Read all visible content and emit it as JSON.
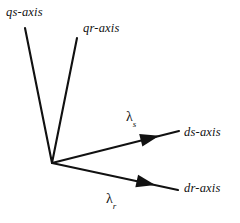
{
  "diagram": {
    "type": "axis-vector-diagram",
    "background_color": "#ffffff",
    "stroke_color": "#111111",
    "origin": {
      "x": 52,
      "y": 163
    },
    "axes": [
      {
        "id": "qs-axis",
        "label": "qs-axis",
        "has_arrowhead": false,
        "from": {
          "x": 52,
          "y": 163
        },
        "to": {
          "x": 25,
          "y": 28
        }
      },
      {
        "id": "qr-axis",
        "label": "qr-axis",
        "has_arrowhead": false,
        "from": {
          "x": 52,
          "y": 163
        },
        "to": {
          "x": 77,
          "y": 38
        }
      },
      {
        "id": "ds-axis",
        "label": "ds-axis",
        "has_arrowhead": true,
        "from": {
          "x": 52,
          "y": 163
        },
        "to": {
          "x": 179,
          "y": 131
        },
        "arrow_at": {
          "x": 150,
          "y": 138
        }
      },
      {
        "id": "dr-axis",
        "label": "dr-axis",
        "has_arrowhead": true,
        "from": {
          "x": 52,
          "y": 163
        },
        "to": {
          "x": 178,
          "y": 190
        },
        "arrow_at": {
          "x": 146,
          "y": 183
        }
      }
    ],
    "angle_labels": [
      {
        "id": "lambda-s",
        "symbol": "λ",
        "subscript": "s"
      },
      {
        "id": "lambda-r",
        "symbol": "λ",
        "subscript": "r"
      }
    ]
  }
}
